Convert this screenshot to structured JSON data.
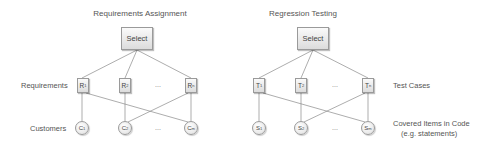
{
  "left": {
    "title": "Requirements Assignment",
    "select_label": "Select",
    "row_labels": {
      "top": "Requirements",
      "bottom": "Customers"
    },
    "top_nodes": [
      {
        "base": "R",
        "sub": "1"
      },
      {
        "base": "R",
        "sub": "2"
      },
      {
        "base": "R",
        "sub": "n"
      }
    ],
    "bottom_nodes": [
      {
        "base": "C",
        "sub": "1"
      },
      {
        "base": "C",
        "sub": "2"
      },
      {
        "base": "C",
        "sub": "m"
      }
    ],
    "ellipsis": "..."
  },
  "right": {
    "title": "Regression Testing",
    "select_label": "Select",
    "row_labels": {
      "top": "Test Cases",
      "bottom_line1": "Covered Items in Code",
      "bottom_line2": "(e.g. statements)"
    },
    "top_nodes": [
      {
        "base": "T",
        "sub": "1"
      },
      {
        "base": "T",
        "sub": "2"
      },
      {
        "base": "T",
        "sub": "n"
      }
    ],
    "bottom_nodes": [
      {
        "base": "S",
        "sub": "1"
      },
      {
        "base": "S",
        "sub": "2"
      },
      {
        "base": "S",
        "sub": "m"
      }
    ],
    "ellipsis": "..."
  },
  "colors": {
    "line": "#888888",
    "node_border": "#9a9a9a",
    "text": "#555555"
  }
}
